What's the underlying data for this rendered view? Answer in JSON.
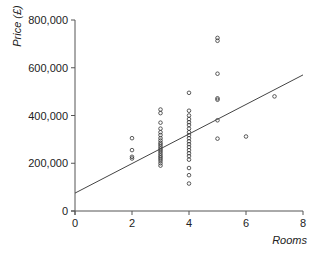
{
  "chart_data": {
    "type": "scatter",
    "title": "",
    "xlabel": "Rooms",
    "ylabel": "Price (£)",
    "xlim": [
      0,
      8
    ],
    "ylim": [
      0,
      800000
    ],
    "x_ticks": [
      0,
      2,
      4,
      6,
      8
    ],
    "x_tick_labels": [
      "0",
      "2",
      "4",
      "6",
      "8"
    ],
    "y_ticks": [
      0,
      200000,
      400000,
      600000,
      800000
    ],
    "y_tick_labels": [
      "0",
      "200,000",
      "400,000",
      "600,000",
      "800,000"
    ],
    "grid": false,
    "legend": null,
    "marker": "open-circle",
    "colors": {
      "marker": "#333333",
      "line": "#444444",
      "axis": "#555555"
    },
    "points": [
      {
        "x": 2,
        "y": 305000
      },
      {
        "x": 2,
        "y": 255000
      },
      {
        "x": 2,
        "y": 227000
      },
      {
        "x": 2,
        "y": 220000
      },
      {
        "x": 3,
        "y": 425000
      },
      {
        "x": 3,
        "y": 410000
      },
      {
        "x": 3,
        "y": 370000
      },
      {
        "x": 3,
        "y": 345000
      },
      {
        "x": 3,
        "y": 330000
      },
      {
        "x": 3,
        "y": 318000
      },
      {
        "x": 3,
        "y": 305000
      },
      {
        "x": 3,
        "y": 295000
      },
      {
        "x": 3,
        "y": 285000
      },
      {
        "x": 3,
        "y": 278000
      },
      {
        "x": 3,
        "y": 270000
      },
      {
        "x": 3,
        "y": 262000
      },
      {
        "x": 3,
        "y": 255000
      },
      {
        "x": 3,
        "y": 248000
      },
      {
        "x": 3,
        "y": 240000
      },
      {
        "x": 3,
        "y": 232000
      },
      {
        "x": 3,
        "y": 225000
      },
      {
        "x": 3,
        "y": 218000
      },
      {
        "x": 3,
        "y": 210000
      },
      {
        "x": 3,
        "y": 200000
      },
      {
        "x": 3,
        "y": 190000
      },
      {
        "x": 4,
        "y": 495000
      },
      {
        "x": 4,
        "y": 420000
      },
      {
        "x": 4,
        "y": 400000
      },
      {
        "x": 4,
        "y": 385000
      },
      {
        "x": 4,
        "y": 372000
      },
      {
        "x": 4,
        "y": 360000
      },
      {
        "x": 4,
        "y": 345000
      },
      {
        "x": 4,
        "y": 330000
      },
      {
        "x": 4,
        "y": 318000
      },
      {
        "x": 4,
        "y": 305000
      },
      {
        "x": 4,
        "y": 292000
      },
      {
        "x": 4,
        "y": 280000
      },
      {
        "x": 4,
        "y": 268000
      },
      {
        "x": 4,
        "y": 255000
      },
      {
        "x": 4,
        "y": 242000
      },
      {
        "x": 4,
        "y": 230000
      },
      {
        "x": 4,
        "y": 215000
      },
      {
        "x": 4,
        "y": 180000
      },
      {
        "x": 4,
        "y": 150000
      },
      {
        "x": 4,
        "y": 115000
      },
      {
        "x": 5,
        "y": 725000
      },
      {
        "x": 5,
        "y": 713000
      },
      {
        "x": 5,
        "y": 575000
      },
      {
        "x": 5,
        "y": 472000
      },
      {
        "x": 5,
        "y": 466000
      },
      {
        "x": 5,
        "y": 380000
      },
      {
        "x": 5,
        "y": 303000
      },
      {
        "x": 6,
        "y": 312000
      },
      {
        "x": 7,
        "y": 480000
      }
    ],
    "regression_line": {
      "x": [
        0,
        8
      ],
      "y": [
        75000,
        570000
      ]
    }
  },
  "axes": {
    "x_title": "Rooms",
    "y_title": "Price (£)"
  }
}
